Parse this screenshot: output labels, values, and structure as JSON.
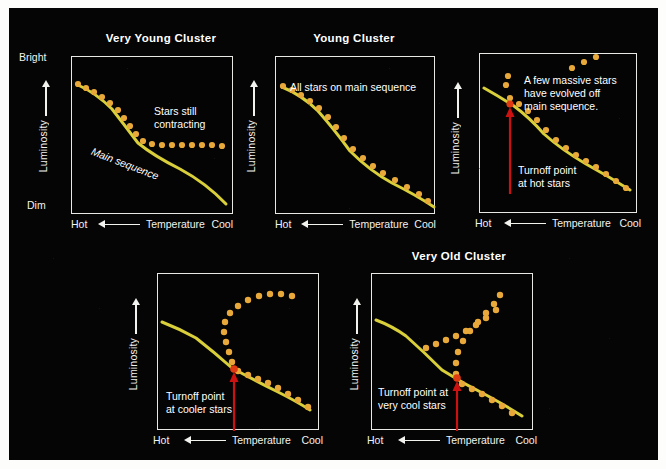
{
  "figure": {
    "background_color": "#050505",
    "page_color": "#fdfdfb",
    "frame_color": "#e8e8e4",
    "main_sequence_color": "#d8cf3a",
    "star_dot_color": "#e8a93a",
    "turnoff_dot_color": "#e03a12",
    "arrow_color": "#cc1111",
    "text_color": "#ffffff"
  },
  "axes": {
    "x_label": "Temperature",
    "x_left": "Hot",
    "x_right": "Cool",
    "y_label": "Luminosity",
    "y_top": "Bright",
    "y_bottom": "Dim"
  },
  "panels": [
    {
      "id": "very-young-cluster",
      "title": "Very Young Cluster",
      "has_title": true,
      "annotations": [
        {
          "id": "stars-still-contracting",
          "text": "Stars still\ncontracting"
        },
        {
          "id": "main-sequence-label",
          "text": "Main sequence"
        }
      ],
      "turnoff_label": "",
      "has_turnoff_arrow": false
    },
    {
      "id": "young-cluster",
      "title": "Young Cluster",
      "has_title": true,
      "annotations": [
        {
          "id": "all-stars-on-main-sequence",
          "text": "All stars on main sequence"
        }
      ],
      "turnoff_label": "",
      "has_turnoff_arrow": false
    },
    {
      "id": "older-cluster",
      "title": "",
      "has_title": false,
      "annotations": [
        {
          "id": "massive-stars-evolved-off",
          "text": "A few massive stars\nhave evolved off\nmain sequence."
        }
      ],
      "turnoff_label": "Turnoff point\nat hot stars",
      "has_turnoff_arrow": true
    },
    {
      "id": "old-cluster",
      "title": "",
      "has_title": false,
      "annotations": [],
      "turnoff_label": "Turnoff point\nat cooler stars",
      "has_turnoff_arrow": true
    },
    {
      "id": "very-old-cluster",
      "title": "Very Old Cluster",
      "has_title": true,
      "annotations": [],
      "turnoff_label": "Turnoff point at\nvery cool stars",
      "has_turnoff_arrow": true
    }
  ],
  "chart_data": {
    "type": "scatter",
    "xlabel": "Temperature",
    "ylabel": "Luminosity",
    "x_direction": "Hot (left) to Cool (right)",
    "y_direction": "Dim (bottom) to Bright (top)",
    "grid": false,
    "legend": "none",
    "panels": [
      {
        "name": "Very Young Cluster",
        "main_sequence_line": [
          [
            6,
            28
          ],
          [
            16,
            34
          ],
          [
            28,
            42
          ],
          [
            40,
            52
          ],
          [
            50,
            64
          ],
          [
            58,
            76
          ],
          [
            66,
            86
          ],
          [
            78,
            96
          ],
          [
            92,
            104
          ],
          [
            108,
            112
          ],
          [
            124,
            122
          ],
          [
            140,
            134
          ],
          [
            154,
            146
          ]
        ],
        "star_points": [
          [
            6,
            27
          ],
          [
            14,
            31
          ],
          [
            22,
            35
          ],
          [
            30,
            40
          ],
          [
            38,
            46
          ],
          [
            46,
            53
          ],
          [
            52,
            60
          ],
          [
            58,
            68
          ],
          [
            64,
            76
          ],
          [
            70,
            83
          ],
          [
            78,
            86
          ],
          [
            88,
            88
          ],
          [
            98,
            88
          ],
          [
            108,
            88
          ],
          [
            118,
            88
          ],
          [
            128,
            88
          ],
          [
            138,
            88
          ],
          [
            148,
            89
          ]
        ],
        "turnoff_point": null
      },
      {
        "name": "Young Cluster",
        "main_sequence_line": [
          [
            6,
            30
          ],
          [
            18,
            36
          ],
          [
            30,
            44
          ],
          [
            42,
            54
          ],
          [
            54,
            66
          ],
          [
            64,
            80
          ],
          [
            74,
            94
          ],
          [
            86,
            106
          ],
          [
            100,
            116
          ],
          [
            116,
            126
          ],
          [
            132,
            134
          ],
          [
            148,
            142
          ],
          [
            160,
            150
          ]
        ],
        "star_points": [
          [
            7,
            29
          ],
          [
            16,
            33
          ],
          [
            25,
            38
          ],
          [
            34,
            44
          ],
          [
            43,
            51
          ],
          [
            52,
            60
          ],
          [
            60,
            70
          ],
          [
            68,
            81
          ],
          [
            76,
            92
          ],
          [
            86,
            101
          ],
          [
            96,
            109
          ],
          [
            106,
            116
          ],
          [
            118,
            123
          ],
          [
            130,
            130
          ],
          [
            142,
            137
          ],
          [
            152,
            144
          ],
          [
            160,
            149
          ]
        ],
        "turnoff_point": null
      },
      {
        "name": "Older Cluster (turnoff at hot stars)",
        "main_sequence_line": [
          [
            4,
            34
          ],
          [
            18,
            42
          ],
          [
            32,
            50
          ],
          [
            44,
            58
          ],
          [
            54,
            68
          ],
          [
            64,
            80
          ],
          [
            76,
            92
          ],
          [
            90,
            102
          ],
          [
            106,
            110
          ],
          [
            122,
            118
          ],
          [
            136,
            126
          ],
          [
            148,
            134
          ]
        ],
        "star_points": [
          [
            28,
            42
          ],
          [
            38,
            48
          ],
          [
            48,
            56
          ],
          [
            58,
            66
          ],
          [
            68,
            78
          ],
          [
            78,
            88
          ],
          [
            88,
            96
          ],
          [
            98,
            104
          ],
          [
            108,
            110
          ],
          [
            118,
            116
          ],
          [
            128,
            122
          ],
          [
            138,
            128
          ],
          [
            146,
            134
          ]
        ],
        "giant_branch_points": [
          [
            26,
            30
          ],
          [
            28,
            22
          ],
          [
            54,
            12
          ],
          [
            66,
            6
          ],
          [
            78,
            2
          ]
        ],
        "turnoff_point": [
          32,
          50
        ]
      },
      {
        "name": "Old Cluster (turnoff at cooler stars)",
        "main_sequence_line": [
          [
            4,
            48
          ],
          [
            20,
            54
          ],
          [
            36,
            62
          ],
          [
            50,
            72
          ],
          [
            62,
            84
          ],
          [
            74,
            94
          ],
          [
            88,
            102
          ],
          [
            104,
            110
          ],
          [
            120,
            118
          ],
          [
            134,
            126
          ],
          [
            146,
            134
          ]
        ],
        "star_points": [
          [
            76,
            96
          ],
          [
            86,
            100
          ],
          [
            96,
            104
          ],
          [
            106,
            108
          ],
          [
            116,
            112
          ],
          [
            126,
            118
          ],
          [
            136,
            124
          ],
          [
            146,
            130
          ]
        ],
        "giant_branch_points": [
          [
            74,
            90
          ],
          [
            70,
            78
          ],
          [
            66,
            66
          ],
          [
            64,
            56
          ],
          [
            66,
            46
          ],
          [
            72,
            38
          ],
          [
            82,
            30
          ],
          [
            94,
            24
          ],
          [
            106,
            22
          ],
          [
            118,
            22
          ],
          [
            130,
            24
          ]
        ],
        "turnoff_point": [
          74,
          94
        ]
      },
      {
        "name": "Very Old Cluster (turnoff at very cool stars)",
        "main_sequence_line": [
          [
            4,
            46
          ],
          [
            18,
            52
          ],
          [
            32,
            60
          ],
          [
            44,
            70
          ],
          [
            56,
            82
          ],
          [
            68,
            94
          ],
          [
            80,
            102
          ],
          [
            94,
            110
          ],
          [
            110,
            118
          ],
          [
            126,
            128
          ],
          [
            140,
            138
          ]
        ],
        "star_points": [
          [
            86,
            108
          ],
          [
            96,
            112
          ],
          [
            106,
            118
          ],
          [
            116,
            124
          ],
          [
            126,
            130
          ],
          [
            136,
            138
          ]
        ],
        "giant_branch_points": [
          [
            82,
            100
          ],
          [
            82,
            88
          ],
          [
            84,
            76
          ],
          [
            90,
            64
          ],
          [
            98,
            54
          ],
          [
            108,
            44
          ],
          [
            118,
            36
          ],
          [
            128,
            30
          ],
          [
            134,
            22
          ]
        ],
        "horizontal_branch_points": [
          [
            56,
            70
          ],
          [
            66,
            66
          ],
          [
            76,
            62
          ],
          [
            86,
            58
          ],
          [
            96,
            54
          ],
          [
            106,
            48
          ],
          [
            116,
            42
          ],
          [
            126,
            34
          ]
        ],
        "turnoff_point": [
          82,
          102
        ]
      }
    ]
  }
}
